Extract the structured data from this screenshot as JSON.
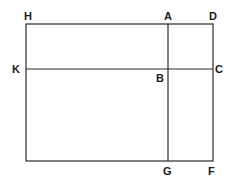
{
  "diagram": {
    "type": "rectangle-partition",
    "stroke_color": "#2a2a2a",
    "background": "#ffffff",
    "points": {
      "H": {
        "label": "H",
        "x": 26,
        "y": 24
      },
      "A": {
        "label": "A",
        "x": 168,
        "y": 24
      },
      "D": {
        "label": "D",
        "x": 213,
        "y": 24
      },
      "K": {
        "label": "K",
        "x": 26,
        "y": 69
      },
      "B": {
        "label": "B",
        "x": 168,
        "y": 69
      },
      "C": {
        "label": "C",
        "x": 213,
        "y": 69
      },
      "G": {
        "label": "G",
        "x": 168,
        "y": 161
      },
      "F": {
        "label": "F",
        "x": 213,
        "y": 161
      }
    },
    "segments": [
      {
        "name": "HD",
        "from": "H",
        "to": "D"
      },
      {
        "name": "KC",
        "from": "K",
        "to": "C"
      },
      {
        "name": "AG",
        "from": "A",
        "to": "G"
      },
      {
        "name": "DF",
        "from": "D",
        "to": "F"
      },
      {
        "name": "H-bottom-left",
        "from": "H",
        "to": "bottom-left"
      },
      {
        "name": "bottom-left-F",
        "from": "bottom-left",
        "to": "F"
      }
    ],
    "labels": {
      "H": "H",
      "A": "A",
      "D": "D",
      "K": "K",
      "B": "B",
      "C": "C",
      "G": "G",
      "F": "F"
    }
  }
}
